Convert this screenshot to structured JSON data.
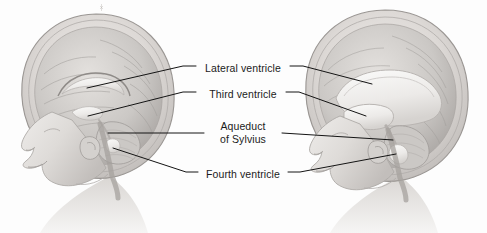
{
  "figure": {
    "background_color": "#fdfdfd",
    "ink_color": "#1b1b1b",
    "width": 487,
    "height": 233
  },
  "labels": [
    {
      "id": "lateral",
      "text": "Lateral ventricle",
      "lines": [
        "Lateral ventricle"
      ]
    },
    {
      "id": "third",
      "text": "Third ventricle",
      "lines": [
        "Third ventricle"
      ]
    },
    {
      "id": "aqueduct",
      "text": "Aqueduct of Sylvius",
      "line1": "Aqueduct",
      "line2": "of Sylvius"
    },
    {
      "id": "fourth",
      "text": "Fourth ventricle",
      "lines": [
        "Fourth ventricle"
      ]
    }
  ],
  "illustrations": [
    {
      "id": "left-head",
      "name": "normal-infant-head-sagittal",
      "description": "Sagittal section of infant head with normal-sized ventricles",
      "orientation": "facing-left",
      "ventricles": "normal"
    },
    {
      "id": "right-head",
      "name": "hydrocephalic-infant-head-sagittal",
      "description": "Sagittal section of infant head with enlarged dilated ventricles",
      "orientation": "facing-left",
      "ventricles": "enlarged"
    }
  ],
  "palette": {
    "paper": "#fdfdfd",
    "skin_light": "#e8e6e4",
    "skin_mid": "#d2cfcc",
    "skin_shadow": "#b4b0ad",
    "skull_outline": "#9a9693",
    "brain_light": "#dedbd8",
    "brain_mid": "#c6c3c0",
    "brain_dark": "#a8a4a1",
    "ventricle_fill": "#f2f1ef",
    "ventricle_edge": "#b9b5b2",
    "leader_line": "#141414"
  }
}
